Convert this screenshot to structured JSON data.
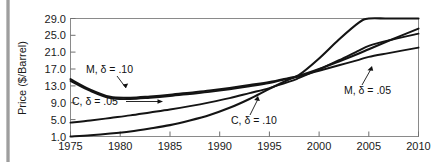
{
  "chart_data": {
    "type": "line",
    "title": "",
    "xlabel": "",
    "ylabel": "Price ($/Barrel)",
    "xlim": [
      1975,
      2010
    ],
    "ylim": [
      1.0,
      29.0
    ],
    "grid": false,
    "legend_position": "inline-annotations",
    "xticks": [
      "1975",
      "1980",
      "1985",
      "1990",
      "1995",
      "2000",
      "2005",
      "2010"
    ],
    "xtick_values": [
      1975,
      1980,
      1985,
      1990,
      1995,
      2000,
      2005,
      2010
    ],
    "yticks": [
      "1.0",
      "5.0",
      "9.0",
      "13.0",
      "17.0",
      "21.0",
      "25.0",
      "29.0"
    ],
    "ytick_values": [
      1.0,
      5.0,
      9.0,
      13.0,
      17.0,
      21.0,
      25.0,
      29.0
    ],
    "x": [
      1975,
      1977,
      1979,
      1981,
      1983,
      1985,
      1987,
      1989,
      1991,
      1993,
      1995,
      1997,
      1998,
      2000,
      2002,
      2004,
      2005,
      2007,
      2010
    ],
    "series": [
      {
        "name": "M, δ = .10",
        "values": [
          14.6,
          12.1,
          10.4,
          10.2,
          10.5,
          10.9,
          11.4,
          11.9,
          12.5,
          13.2,
          13.9,
          14.9,
          15.4,
          17.0,
          18.8,
          20.7,
          21.7,
          23.7,
          26.6
        ]
      },
      {
        "name": "M, δ = .05",
        "values": [
          14.2,
          11.8,
          10.1,
          9.9,
          10.2,
          10.6,
          11.1,
          11.6,
          12.2,
          12.9,
          13.7,
          14.8,
          15.3,
          16.6,
          17.9,
          19.2,
          19.9,
          20.8,
          22.1
        ]
      },
      {
        "name": "C, δ = .05",
        "values": [
          4.3,
          4.8,
          5.4,
          6.0,
          6.7,
          7.4,
          8.2,
          9.1,
          10.1,
          11.3,
          12.5,
          14.0,
          14.9,
          16.9,
          19.1,
          21.4,
          22.5,
          23.8,
          25.4
        ]
      },
      {
        "name": "C, δ = .10",
        "values": [
          1.0,
          1.3,
          1.7,
          2.2,
          2.9,
          3.7,
          4.8,
          6.1,
          7.8,
          9.9,
          12.3,
          14.6,
          15.6,
          19.5,
          24.0,
          28.0,
          29.0,
          29.0,
          29.0
        ]
      }
    ],
    "annotations": [
      {
        "text": "M, δ = .10",
        "target_x": 1981.5,
        "target_y": 10.3,
        "note": "arrow points down-right to the upper pair of M curves near their minimum"
      },
      {
        "text": "C, δ = .05",
        "target_x": 1985.0,
        "target_y": 7.4,
        "note": "horizontal arrow points right to the C .05 curve"
      },
      {
        "text": "C, δ = .10",
        "target_x": 1996.5,
        "target_y": 13.5,
        "note": "arrow points up-left to the steep C .10 curve"
      },
      {
        "text": "M, δ = .05",
        "target_x": 2006.0,
        "target_y": 20.3,
        "note": "arrow points up-left to the lower M curve"
      }
    ],
    "crossover": {
      "x": 1998,
      "y": 15.5,
      "note": "all four curves intersect in a narrow bundle just before 2000"
    }
  },
  "colors": {
    "curve": "#141414",
    "frame": "#8a8a8a",
    "text": "#1a1a1a",
    "page_rule": "#8d8d8d",
    "background": "#ffffff"
  }
}
